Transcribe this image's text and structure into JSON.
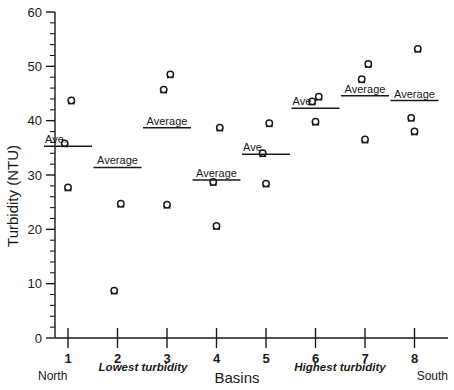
{
  "chart_data": {
    "type": "scatter",
    "title": "",
    "xlabel": "Basins",
    "ylabel": "Turbidity (NTU)",
    "ylim": [
      0,
      60
    ],
    "xlim": [
      0.5,
      8.7
    ],
    "grid": false,
    "legend": null,
    "ytick_labels": [
      "0",
      "10",
      "20",
      "30",
      "40",
      "50",
      "60"
    ],
    "ytick_values": [
      0,
      10,
      20,
      30,
      40,
      50,
      60
    ],
    "ytick_minor_step": 2,
    "xtick_labels": [
      "1",
      "2",
      "3",
      "4",
      "5",
      "6",
      "7",
      "8"
    ],
    "xtick_values": [
      1,
      2,
      3,
      4,
      5,
      6,
      7,
      8
    ],
    "marker_symbol": "open-circle-with-stem",
    "categories": [
      "1",
      "2",
      "3",
      "4",
      "5",
      "6",
      "7",
      "8"
    ],
    "series": [
      {
        "name": "Turbidity measurements",
        "points": [
          {
            "basin": 1,
            "value": 43.5
          },
          {
            "basin": 1,
            "value": 35.6
          },
          {
            "basin": 1,
            "value": 27.5
          },
          {
            "basin": 2,
            "value": 24.5
          },
          {
            "basin": 2,
            "value": 8.5
          },
          {
            "basin": 3,
            "value": 48.3
          },
          {
            "basin": 3,
            "value": 45.5
          },
          {
            "basin": 3,
            "value": 24.3
          },
          {
            "basin": 4,
            "value": 38.5
          },
          {
            "basin": 4,
            "value": 28.5
          },
          {
            "basin": 4,
            "value": 20.4
          },
          {
            "basin": 5,
            "value": 39.3
          },
          {
            "basin": 5,
            "value": 33.8
          },
          {
            "basin": 5,
            "value": 28.2
          },
          {
            "basin": 6,
            "value": 44.2
          },
          {
            "basin": 6,
            "value": 43.3
          },
          {
            "basin": 6,
            "value": 39.6
          },
          {
            "basin": 7,
            "value": 50.2
          },
          {
            "basin": 7,
            "value": 47.4
          },
          {
            "basin": 7,
            "value": 36.3
          },
          {
            "basin": 8,
            "value": 53.0
          },
          {
            "basin": 8,
            "value": 40.3
          },
          {
            "basin": 8,
            "value": 37.8
          }
        ]
      }
    ],
    "averages": [
      {
        "basin": 1,
        "value": 35.3,
        "label": "Ave.",
        "label_side": "left"
      },
      {
        "basin": 2,
        "value": 31.4,
        "label": "Average",
        "label_side": "above"
      },
      {
        "basin": 3,
        "value": 38.7,
        "label": "Average",
        "label_side": "above"
      },
      {
        "basin": 4,
        "value": 29.1,
        "label": "Average",
        "label_side": "above"
      },
      {
        "basin": 5,
        "value": 33.8,
        "label": "Ave.",
        "label_side": "left"
      },
      {
        "basin": 6,
        "value": 42.3,
        "label": "Ave.",
        "label_side": "left"
      },
      {
        "basin": 7,
        "value": 44.6,
        "label": "Average",
        "label_side": "above"
      },
      {
        "basin": 8,
        "value": 43.7,
        "label": "Average",
        "label_side": "above"
      }
    ],
    "annotations": [
      {
        "name": "north-label",
        "text": "North"
      },
      {
        "name": "south-label",
        "text": "South"
      },
      {
        "name": "lowest-turbidity-label",
        "text": "Lowest turbidity"
      },
      {
        "name": "highest-turbidity-label",
        "text": "Highest turbidity"
      }
    ]
  },
  "axes": {
    "y_title": "Turbidity (NTU)",
    "x_title": "Basins"
  },
  "labels": {
    "north": "North",
    "south": "South",
    "lowest_turbidity": "Lowest turbidity",
    "highest_turbidity": "Highest turbidity",
    "y0": "0",
    "y10": "10",
    "y20": "20",
    "y30": "30",
    "y40": "40",
    "y50": "50",
    "y60": "60",
    "x1": "1",
    "x2": "2",
    "x3": "3",
    "x4": "4",
    "x5": "5",
    "x6": "6",
    "x7": "7",
    "x8": "8"
  },
  "colors": {
    "ink": "#1a1a1a",
    "background": "#ffffff"
  }
}
